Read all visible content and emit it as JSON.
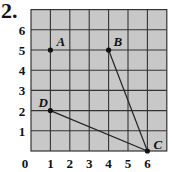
{
  "problem_number": "2.",
  "grid": {
    "x_max": 7,
    "y_max": 7,
    "fill": "#c8c8c8",
    "line_color": "#333333"
  },
  "axis": {
    "x_ticks": [
      "0",
      "1",
      "2",
      "3",
      "4",
      "5",
      "6"
    ],
    "y_ticks": [
      "1",
      "2",
      "3",
      "4",
      "5",
      "6"
    ]
  },
  "points": [
    {
      "label": "A",
      "x": 1,
      "y": 5
    },
    {
      "label": "B",
      "x": 4,
      "y": 5
    },
    {
      "label": "C",
      "x": 6,
      "y": 0
    },
    {
      "label": "D",
      "x": 1,
      "y": 2
    }
  ],
  "segments": [
    [
      "B",
      "C"
    ],
    [
      "D",
      "C"
    ]
  ]
}
